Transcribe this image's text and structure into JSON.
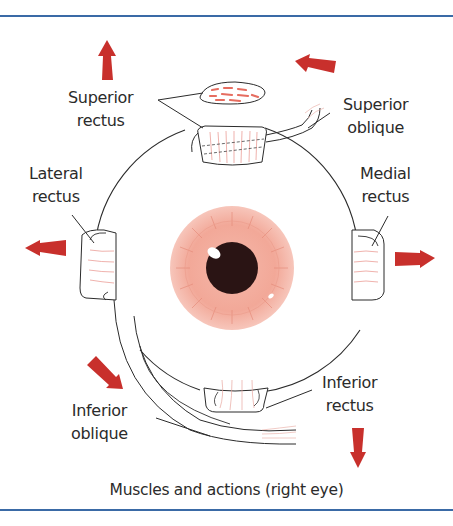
{
  "diagram": {
    "caption": "Muscles and actions (right eye)",
    "labels": {
      "superior_rectus": {
        "line1": "Superior",
        "line2": "rectus"
      },
      "superior_oblique": {
        "line1": "Superior",
        "line2": "oblique"
      },
      "lateral_rectus": {
        "line1": "Lateral",
        "line2": "rectus"
      },
      "medial_rectus": {
        "line1": "Medial",
        "line2": "rectus"
      },
      "inferior_oblique": {
        "line1": "Inferior",
        "line2": "oblique"
      },
      "inferior_rectus": {
        "line1": "Inferior",
        "line2": "rectus"
      }
    },
    "arrows": [
      {
        "muscle": "superior_rectus",
        "direction": "up"
      },
      {
        "muscle": "superior_oblique",
        "direction": "left"
      },
      {
        "muscle": "lateral_rectus",
        "direction": "left"
      },
      {
        "muscle": "medial_rectus",
        "direction": "right"
      },
      {
        "muscle": "inferior_oblique",
        "direction": "down-right"
      },
      {
        "muscle": "inferior_rectus",
        "direction": "down"
      }
    ],
    "colors": {
      "frame": "#3a6aa6",
      "arrow": "#c8302c",
      "iris": "#f2b0a3",
      "iris_fibers": "#e0806e",
      "pupil": "#2a1414",
      "muscle_fibers": "#e88a80",
      "outline": "#2b2b2b"
    }
  }
}
